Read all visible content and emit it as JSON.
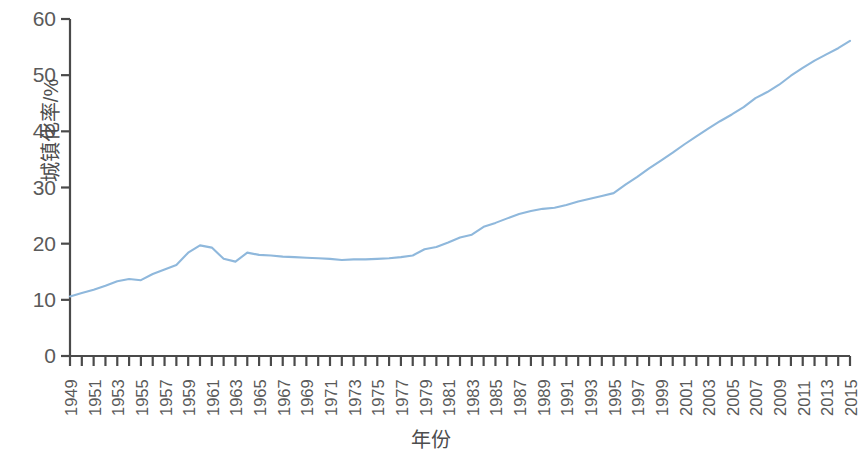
{
  "chart_data": {
    "type": "line",
    "title": "",
    "xlabel": "年份",
    "ylabel": "城镇化率/%",
    "xlim": [
      1949,
      2015
    ],
    "ylim": [
      0,
      60
    ],
    "ytick_values": [
      0,
      10,
      20,
      30,
      40,
      50,
      60
    ],
    "ytick_labels": [
      "0",
      "10",
      "20",
      "30",
      "40",
      "50",
      "60"
    ],
    "xtick_labels": [
      "1949",
      "1951",
      "1953",
      "1955",
      "1957",
      "1959",
      "1961",
      "1963",
      "1965",
      "1967",
      "1969",
      "1971",
      "1973",
      "1975",
      "1977",
      "1979",
      "1981",
      "1983",
      "1985",
      "1987",
      "1989",
      "1991",
      "1993",
      "1995",
      "1997",
      "1999",
      "2001",
      "2003",
      "2005",
      "2007",
      "2009",
      "2011",
      "2013",
      "2015"
    ],
    "xtick_minor_step": 1,
    "xtick_major_step": 2,
    "grid": false,
    "legend": null,
    "series": [
      {
        "name": "城镇化率",
        "color": "#8fb8dc",
        "x": [
          1949,
          1950,
          1951,
          1952,
          1953,
          1954,
          1955,
          1956,
          1957,
          1958,
          1959,
          1960,
          1961,
          1962,
          1963,
          1964,
          1965,
          1966,
          1967,
          1968,
          1969,
          1970,
          1971,
          1972,
          1973,
          1974,
          1975,
          1976,
          1977,
          1978,
          1979,
          1980,
          1981,
          1982,
          1983,
          1984,
          1985,
          1986,
          1987,
          1988,
          1989,
          1990,
          1991,
          1992,
          1993,
          1994,
          1995,
          1996,
          1997,
          1998,
          1999,
          2000,
          2001,
          2002,
          2003,
          2004,
          2005,
          2006,
          2007,
          2008,
          2009,
          2010,
          2011,
          2012,
          2013,
          2014,
          2015
        ],
        "values": [
          10.6,
          11.2,
          11.8,
          12.5,
          13.3,
          13.7,
          13.5,
          14.6,
          15.4,
          16.2,
          18.4,
          19.7,
          19.3,
          17.3,
          16.8,
          18.4,
          18.0,
          17.9,
          17.7,
          17.6,
          17.5,
          17.4,
          17.3,
          17.1,
          17.2,
          17.2,
          17.3,
          17.4,
          17.6,
          17.9,
          19.0,
          19.4,
          20.2,
          21.1,
          21.6,
          23.0,
          23.7,
          24.5,
          25.3,
          25.8,
          26.2,
          26.4,
          26.9,
          27.5,
          28.0,
          28.5,
          29.0,
          30.5,
          31.9,
          33.4,
          34.8,
          36.2,
          37.7,
          39.1,
          40.5,
          41.8,
          43.0,
          44.3,
          45.9,
          47.0,
          48.3,
          49.9,
          51.3,
          52.6,
          53.7,
          54.8,
          56.1
        ]
      }
    ]
  },
  "axis": {
    "y_title": "城镇化率/%",
    "x_title": "年份"
  }
}
